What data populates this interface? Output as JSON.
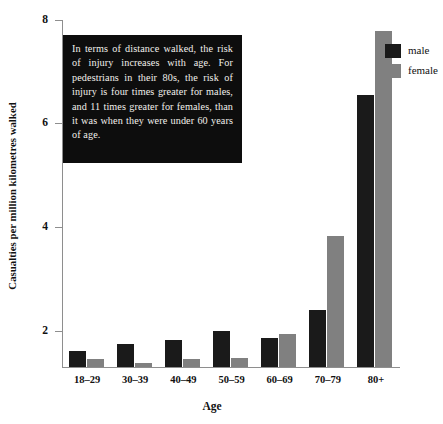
{
  "chart_data": {
    "type": "bar",
    "title": "",
    "subtitle": "",
    "xlabel": "Age",
    "ylabel": "Casualties per million kilometres walked",
    "categories": [
      "18–29",
      "30–39",
      "40–49",
      "50–59",
      "60–69",
      "70–79",
      "80+"
    ],
    "series": [
      {
        "name": "male",
        "color": "#1a1a1a",
        "values": [
          1.6,
          1.75,
          1.82,
          2.0,
          1.87,
          2.4,
          6.54
        ]
      },
      {
        "name": "female",
        "color": "#808080",
        "values": [
          1.46,
          1.37,
          1.45,
          1.48,
          1.94,
          3.83,
          7.79
        ]
      }
    ],
    "y_ticks": [
      2,
      4,
      6,
      8
    ],
    "ylim": [
      1.3,
      8.15
    ],
    "axis_floor_value": 1.3,
    "grid": false,
    "legend_position": "top-right",
    "annotations": [
      {
        "name": "callout-note",
        "text": "In terms of distance walked, the risk of injury increases with age. For pedestrians in their 80s, the risk of injury is four times greater for males, and 11 times greater for females, than it was when they were under 60 years of age."
      }
    ]
  },
  "legend": {
    "items": [
      {
        "label": "male",
        "swatch_color": "#1a1a1a"
      },
      {
        "label": "female",
        "swatch_color": "#808080"
      }
    ]
  },
  "axes": {
    "y_tick_labels": [
      "8",
      "6",
      "4",
      "2"
    ],
    "y_title": "Casualties per million kilometres walked",
    "x_title": "Age",
    "x_tick_labels": [
      "18–29",
      "30–39",
      "40–49",
      "50–59",
      "60–69",
      "70–79",
      "80+"
    ]
  },
  "callout": {
    "text": "In terms of distance walked, the risk of injury increases with age. For pedestrians in their 80s, the risk of injury is four times greater for males, and 11 times greater for females, than it was when they were under 60 years of age.",
    "background_color": "#0d0d0d",
    "text_color": "#f2f0ec"
  }
}
